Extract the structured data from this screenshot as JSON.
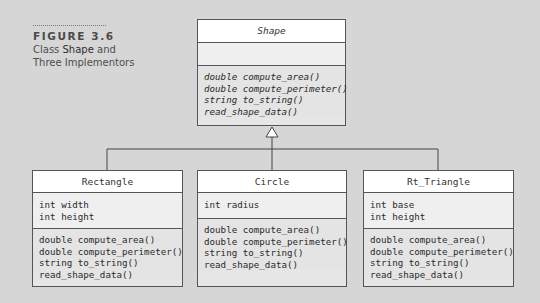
{
  "caption": {
    "label": "FIGURE 3.6",
    "text_line1_prefix": "Class ",
    "text_line1_em": "Shape",
    "text_line1_suffix": " and",
    "text_line2": "Three Implementors"
  },
  "base_class": {
    "name": "Shape",
    "abstract": true,
    "attributes": [],
    "methods": [
      "double compute_area()",
      "double compute_perimeter()",
      "string to_string()",
      "read_shape_data()"
    ]
  },
  "subclasses": [
    {
      "name": "Rectangle",
      "attributes": [
        "int width",
        "int height"
      ],
      "methods": [
        "double compute_area()",
        "double compute_perimeter()",
        "string to_string()",
        "read_shape_data()"
      ]
    },
    {
      "name": "Circle",
      "attributes": [
        "int radius"
      ],
      "methods": [
        "double compute_area()",
        "double compute_perimeter()",
        "string to_string()",
        "read_shape_data()"
      ]
    },
    {
      "name": "Rt_Triangle",
      "attributes": [
        "int base",
        "int height"
      ],
      "methods": [
        "double compute_area()",
        "double compute_perimeter()",
        "string to_string()",
        "read_shape_data()"
      ]
    }
  ],
  "relationship": "generalization",
  "colors": {
    "background": "#d6d6d6",
    "box_border": "#555555",
    "name_fill": "#ffffff",
    "body_fill": "#e6e6e6"
  }
}
